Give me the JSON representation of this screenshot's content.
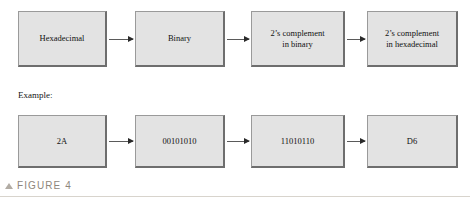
{
  "figure": {
    "caption_marker": "triangle-up-icon",
    "caption_text": "FIGURE 4",
    "example_label": "Example:"
  },
  "flow": {
    "process_row": {
      "name": "conversion-process-steps",
      "steps": [
        {
          "id": "hexadecimal",
          "label": "Hexadecimal"
        },
        {
          "id": "binary",
          "label": "Binary"
        },
        {
          "id": "twos-complement-binary",
          "line1": "2’s complement",
          "line2": "in binary"
        },
        {
          "id": "twos-complement-hexadecimal",
          "line1": "2’s complement",
          "line2": "in hexadecimal"
        }
      ]
    },
    "example_row": {
      "name": "conversion-example-values",
      "steps": [
        {
          "id": "example-hexadecimal",
          "label": "2A"
        },
        {
          "id": "example-binary",
          "label": "00101010"
        },
        {
          "id": "example-twos-complement-binary",
          "label": "11010110"
        },
        {
          "id": "example-twos-complement-hexadecimal",
          "label": "D6"
        }
      ]
    }
  },
  "colors": {
    "box_fill": "#e3e3e3",
    "box_border": "#9a9a9a",
    "box_border_shadow": "#6e6e6e",
    "arrow": "#5a5a5a",
    "caption_text": "#8e867c",
    "caption_marker": "#b2aca4",
    "rule": "#d8d4cd",
    "text": "#111111"
  }
}
